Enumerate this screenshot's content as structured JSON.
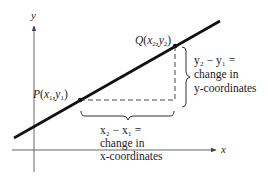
{
  "diagram": {
    "type": "slope-between-two-points",
    "axes": {
      "x_label": "x",
      "y_label": "y"
    },
    "points": {
      "P": {
        "name": "P",
        "x_sub": "1",
        "y_sub": "1"
      },
      "Q": {
        "name": "Q",
        "x_sub": "2",
        "y_sub": "2"
      }
    },
    "annotations": {
      "vertical_change": {
        "line1": "y₂ − y₁ =",
        "line2": "change in",
        "line3": "y-coordinates"
      },
      "horizontal_change": {
        "line1": "x₂ − x₁ =",
        "line2": "change in",
        "line3": "x-coordinates"
      }
    },
    "colors": {
      "line": "#111111",
      "axis": "#555555",
      "text": "#222222"
    }
  }
}
